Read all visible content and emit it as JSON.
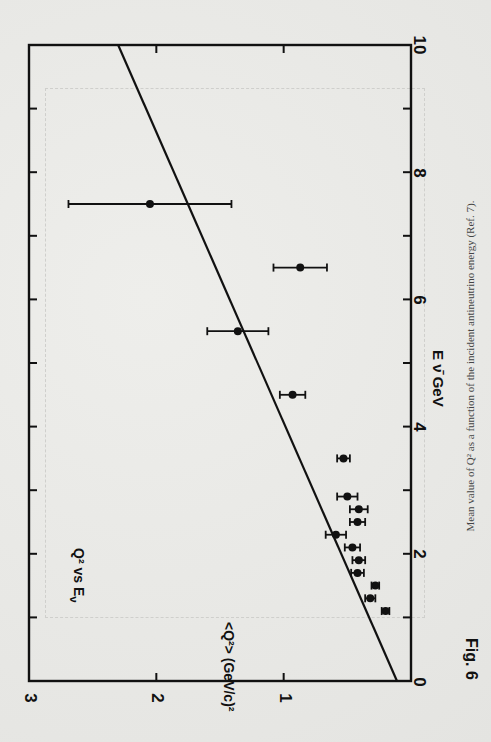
{
  "figure": {
    "fig_label": "Fig. 6",
    "inset_title": "Q² vs E",
    "inset_title_sub": "ν",
    "caption": "Mean value of Q² as a function of the incident antineutrino energy (Ref. 7)."
  },
  "chart_data": {
    "type": "scatter",
    "title": "Q² vs Eν",
    "xlabel": "E ν̄ GeV",
    "ylabel": "<Q²> (GeV/c)²",
    "xlim": [
      0,
      10
    ],
    "ylim": [
      0,
      3
    ],
    "x_ticks": [
      "0",
      "2",
      "4",
      "6",
      "8",
      "10"
    ],
    "y_ticks": [
      "0",
      "1",
      "2",
      "3"
    ],
    "grid": false,
    "orientation": "rotated 90° (x axis vertical on page)",
    "series": [
      {
        "name": "data",
        "points": [
          {
            "x": 1.1,
            "y": 0.2,
            "yerr": 0.03
          },
          {
            "x": 1.3,
            "y": 0.32,
            "yerr": 0.04
          },
          {
            "x": 1.5,
            "y": 0.28,
            "yerr": 0.03
          },
          {
            "x": 1.7,
            "y": 0.42,
            "yerr": 0.05
          },
          {
            "x": 1.9,
            "y": 0.41,
            "yerr": 0.05
          },
          {
            "x": 2.1,
            "y": 0.46,
            "yerr": 0.06
          },
          {
            "x": 2.3,
            "y": 0.59,
            "yerr": 0.08
          },
          {
            "x": 2.5,
            "y": 0.42,
            "yerr": 0.06
          },
          {
            "x": 2.7,
            "y": 0.41,
            "yerr": 0.07
          },
          {
            "x": 2.9,
            "y": 0.5,
            "yerr": 0.08
          },
          {
            "x": 3.5,
            "y": 0.53,
            "yerr": 0.05
          },
          {
            "x": 4.5,
            "y": 0.93,
            "yerr": 0.1
          },
          {
            "x": 5.5,
            "y": 1.36,
            "yerr": 0.24
          },
          {
            "x": 6.5,
            "y": 0.87,
            "yerr": 0.21
          },
          {
            "x": 7.5,
            "y": 2.05,
            "yerr": 0.64
          }
        ]
      },
      {
        "name": "fit line",
        "type": "line",
        "x": [
          0,
          10
        ],
        "y": [
          0.11,
          2.3
        ]
      }
    ]
  }
}
